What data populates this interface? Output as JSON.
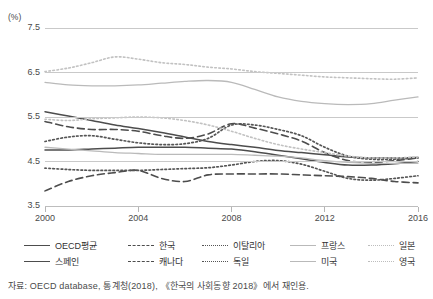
{
  "axes": {
    "y_unit": "(%)",
    "y_ticks": [
      "7.5",
      "6.5",
      "5.5",
      "4.5",
      "3.5"
    ],
    "x_ticks": [
      "2000",
      "2004",
      "2008",
      "2012",
      "2016"
    ]
  },
  "legend": {
    "items": [
      {
        "label": "OECD평균",
        "style": "solid-dark",
        "col": 0,
        "row": 0
      },
      {
        "label": "스페인",
        "style": "solid-dark",
        "col": 0,
        "row": 1
      },
      {
        "label": "한국",
        "style": "dash-dark",
        "col": 1,
        "row": 0
      },
      {
        "label": "캐나다",
        "style": "dash-dark",
        "col": 1,
        "row": 1
      },
      {
        "label": "이탈리아",
        "style": "dot-dark",
        "col": 2,
        "row": 0
      },
      {
        "label": "독일",
        "style": "dot-dark",
        "col": 2,
        "row": 1
      },
      {
        "label": "프랑스",
        "style": "solid-lt",
        "col": 3,
        "row": 0
      },
      {
        "label": "미국",
        "style": "solid-lt",
        "col": 3,
        "row": 1
      },
      {
        "label": "일본",
        "style": "dot-lt",
        "col": 4,
        "row": 0
      },
      {
        "label": "영국",
        "style": "dot-lt",
        "col": 4,
        "row": 1
      }
    ]
  },
  "source": {
    "text": "자료: OECD database, 통계청(2018), 《한국의 사회동향 2018》에서 재인용."
  },
  "colors": {
    "dark_line": "#4d4d4d",
    "light_line": "#b9b9b9",
    "grid": "#c9c9c9",
    "text": "#3a3a3a"
  },
  "chart_data": {
    "type": "line",
    "title": "",
    "xlabel": "",
    "ylabel": "(%)",
    "xlim": [
      2000,
      2016
    ],
    "ylim": [
      3.5,
      7.5
    ],
    "grid": true,
    "legend_position": "bottom",
    "x": [
      2000,
      2001,
      2002,
      2003,
      2004,
      2005,
      2006,
      2007,
      2008,
      2009,
      2010,
      2011,
      2012,
      2013,
      2014,
      2015,
      2016
    ],
    "series": [
      {
        "name": "OECD평균",
        "style": "solid-dark",
        "values": [
          5.62,
          5.52,
          5.42,
          5.32,
          5.24,
          5.15,
          5.05,
          4.95,
          4.88,
          4.82,
          4.75,
          4.7,
          4.65,
          4.6,
          4.58,
          4.58,
          4.59
        ]
      },
      {
        "name": "스페인",
        "style": "solid-dark",
        "values": [
          4.76,
          4.76,
          4.78,
          4.8,
          4.82,
          4.82,
          4.82,
          4.8,
          4.78,
          4.72,
          4.64,
          4.56,
          4.48,
          4.42,
          4.42,
          4.45,
          4.5
        ]
      },
      {
        "name": "한국",
        "style": "dash-dark",
        "values": [
          3.84,
          4.05,
          4.18,
          4.25,
          4.3,
          4.12,
          4.05,
          4.2,
          4.22,
          4.22,
          4.22,
          4.2,
          4.18,
          4.16,
          4.12,
          4.05,
          4.02
        ]
      },
      {
        "name": "캐나다",
        "style": "dash-dark",
        "values": [
          5.4,
          5.28,
          5.22,
          5.22,
          5.18,
          5.08,
          5.02,
          5.12,
          5.35,
          5.25,
          5.12,
          4.96,
          4.7,
          4.52,
          4.48,
          4.52,
          4.58
        ]
      },
      {
        "name": "이탈리아",
        "style": "dot-dark",
        "values": [
          4.95,
          5.05,
          5.08,
          5.0,
          4.92,
          4.88,
          4.9,
          5.02,
          5.32,
          5.32,
          5.22,
          5.08,
          4.82,
          4.62,
          4.55,
          4.55,
          4.58
        ]
      },
      {
        "name": "독일",
        "style": "dot-dark",
        "values": [
          4.35,
          4.32,
          4.3,
          4.3,
          4.3,
          4.32,
          4.34,
          4.36,
          4.42,
          4.5,
          4.52,
          4.44,
          4.28,
          4.12,
          4.08,
          4.12,
          4.18
        ]
      },
      {
        "name": "프랑스",
        "style": "solid-lt",
        "values": [
          6.28,
          6.22,
          6.2,
          6.2,
          6.22,
          6.26,
          6.3,
          6.32,
          6.28,
          6.12,
          5.95,
          5.85,
          5.8,
          5.78,
          5.8,
          5.88,
          5.95
        ]
      },
      {
        "name": "미국",
        "style": "solid-lt",
        "values": [
          4.82,
          4.78,
          4.74,
          4.7,
          4.68,
          4.66,
          4.66,
          4.66,
          4.66,
          4.64,
          4.62,
          4.58,
          4.52,
          4.48,
          4.46,
          4.46,
          4.46
        ]
      },
      {
        "name": "일본",
        "style": "dot-lt",
        "values": [
          6.52,
          6.6,
          6.72,
          6.85,
          6.8,
          6.72,
          6.68,
          6.62,
          6.58,
          6.52,
          6.48,
          6.44,
          6.4,
          6.38,
          6.36,
          6.35,
          6.38
        ]
      },
      {
        "name": "영국",
        "style": "dot-lt",
        "values": [
          5.45,
          5.42,
          5.46,
          5.48,
          5.5,
          5.48,
          5.42,
          5.32,
          5.18,
          5.02,
          4.88,
          4.78,
          4.7,
          4.62,
          4.58,
          4.58,
          4.6
        ]
      }
    ]
  }
}
